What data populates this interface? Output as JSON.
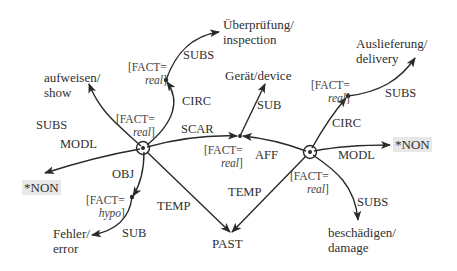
{
  "nodes": {
    "aufweisen": {
      "line1": "aufweisen/",
      "line2": "show"
    },
    "ueberpruefung": {
      "line1": "Überprüfung/",
      "line2": "inspection"
    },
    "geraet": {
      "line1": "Gerät/device"
    },
    "auslieferung": {
      "line1": "Auslieferung/",
      "line2": "delivery"
    },
    "non_left": {
      "line1": "*NON"
    },
    "non_right": {
      "line1": "*NON"
    },
    "fehler": {
      "line1": "Fehler/",
      "line2": "error"
    },
    "past": {
      "line1": "PAST"
    },
    "beschaedigen": {
      "line1": "beschädigen/",
      "line2": "damage"
    }
  },
  "facts": {
    "left_node": {
      "key": "[FACT=",
      "value": "real",
      "close": "]"
    },
    "circ_left": {
      "key": "[FACT=",
      "value": "real",
      "close": "]"
    },
    "scar_aff": {
      "key": "[FACT=",
      "value": "real",
      "close": "]"
    },
    "circ_right": {
      "key": "[FACT=",
      "value": "real",
      "close": "]"
    },
    "right_node": {
      "key": "[FACT=",
      "value": "real",
      "close": "]"
    },
    "obj": {
      "key": "[FACT=",
      "value": "hypo",
      "close": "]"
    }
  },
  "edges": {
    "subs_left": "SUBS",
    "subs_circ_left": "SUBS",
    "circ_left": "CIRC",
    "modl_left": "MODL",
    "scar": "SCAR",
    "sub_geraet": "SUB",
    "aff": "AFF",
    "circ_right": "CIRC",
    "subs_right_top": "SUBS",
    "modl_right": "MODL",
    "obj": "OBJ",
    "sub_fehler": "SUB",
    "temp_left": "TEMP",
    "temp_right": "TEMP",
    "subs_right_bottom": "SUBS"
  },
  "colors": {
    "line": "#2a2a2a",
    "text": "#2f2f2f",
    "highlight": "#e8e8e8"
  }
}
